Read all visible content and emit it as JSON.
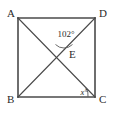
{
  "figure": {
    "kind": "geometry-diagram",
    "shape": "square",
    "background_color": "#ffffff",
    "stroke_color": "#4a4a4a",
    "text_color": "#2b2b2b",
    "vertices": [
      {
        "id": "A",
        "label": "A",
        "position": "top-left",
        "x": 18,
        "y": 18
      },
      {
        "id": "D",
        "label": "D",
        "position": "top-right",
        "x": 95,
        "y": 18
      },
      {
        "id": "B",
        "label": "B",
        "position": "bottom-left",
        "x": 18,
        "y": 97
      },
      {
        "id": "C",
        "label": "C",
        "position": "bottom-right",
        "x": 95,
        "y": 97
      }
    ],
    "interior_point": {
      "id": "E",
      "label": "E",
      "x": 64,
      "y": 53
    },
    "edges": [
      {
        "from": "A",
        "to": "D"
      },
      {
        "from": "D",
        "to": "C"
      },
      {
        "from": "C",
        "to": "B"
      },
      {
        "from": "B",
        "to": "A"
      }
    ],
    "diagonals": [
      {
        "from": "A",
        "to": "C",
        "through": "E"
      },
      {
        "from": "B",
        "to": "D",
        "through": "E"
      }
    ],
    "angles": [
      {
        "id": "angle-at-e",
        "label": "102°",
        "value": "102",
        "unit": "°",
        "at": "E",
        "x": 66,
        "y": 37
      },
      {
        "id": "angle-at-c",
        "label": "x°",
        "value": "x",
        "unit": "°",
        "at": "C",
        "x": 84,
        "y": 95
      }
    ],
    "vertex_label_offsets": [
      {
        "id": "A",
        "x": 7,
        "y": 17
      },
      {
        "id": "D",
        "x": 99,
        "y": 17
      },
      {
        "id": "B",
        "x": 7,
        "y": 103
      },
      {
        "id": "C",
        "x": 99,
        "y": 103
      },
      {
        "id": "E",
        "x": 69,
        "y": 58
      }
    ]
  }
}
